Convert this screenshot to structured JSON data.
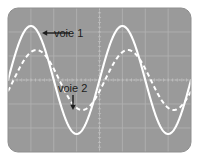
{
  "figure": {
    "background_color": "#ffffff"
  },
  "scope": {
    "name": "oscilloscope-screen",
    "screen_color": "#9a9a9a",
    "grid_color": "#b0b0b0",
    "grid_center_color": "#c0c0c0",
    "trace_color": "#ffffff",
    "bezel_radius_px": 10,
    "screen_rect": {
      "x": 8,
      "y": 8,
      "width": 183,
      "height": 144
    },
    "grid": {
      "columns": 8,
      "rows": 6,
      "center_lines_dotted": true
    }
  },
  "annotations": [
    {
      "id": "voie-1",
      "label": "voie 1",
      "text_x": 54,
      "text_y": 37,
      "arrow": {
        "from_x": 70,
        "from_y": 33,
        "to_x": 42,
        "to_y": 33,
        "direction": "left"
      },
      "color": "#1c1c1c"
    },
    {
      "id": "voie-2",
      "label": "voie 2",
      "text_x": 58,
      "text_y": 92,
      "arrow": {
        "from_x": 73,
        "from_y": 95,
        "to_x": 73,
        "to_y": 110,
        "direction": "down"
      },
      "color": "#1c1c1c"
    }
  ],
  "chart_data": {
    "type": "line",
    "title": "",
    "xlabel": "",
    "ylabel": "",
    "xlim": [
      0,
      8
    ],
    "ylim": [
      -3,
      3
    ],
    "grid": true,
    "legend_position": "inline-annotations",
    "series": [
      {
        "name": "voie 1",
        "style": "solid",
        "color": "#ffffff",
        "amplitude_div": 2.25,
        "periods_visible": 2,
        "period_div": 4.0,
        "phase_deg": 0,
        "offset_div": 0,
        "samples_x": [
          0.0,
          0.25,
          0.5,
          0.75,
          1.0,
          1.25,
          1.5,
          1.75,
          2.0,
          2.25,
          2.5,
          2.75,
          3.0,
          3.25,
          3.5,
          3.75,
          4.0,
          4.25,
          4.5,
          4.75,
          5.0,
          5.25,
          5.5,
          5.75,
          6.0,
          6.25,
          6.5,
          6.75,
          7.0,
          7.25,
          7.5,
          7.75,
          8.0
        ],
        "samples_y": [
          0.0,
          0.86,
          1.59,
          2.08,
          2.25,
          2.08,
          1.59,
          0.86,
          0.0,
          -0.86,
          -1.59,
          -2.08,
          -2.25,
          -2.08,
          -1.59,
          -0.86,
          0.0,
          0.86,
          1.59,
          2.08,
          2.25,
          2.08,
          1.59,
          0.86,
          0.0,
          -0.86,
          -1.59,
          -2.08,
          -2.25,
          -2.08,
          -1.59,
          -0.86,
          0.0
        ]
      },
      {
        "name": "voie 2",
        "style": "dashed",
        "color": "#ffffff",
        "amplitude_div": 1.25,
        "periods_visible": 2,
        "period_div": 4.0,
        "phase_deg": -22,
        "offset_div": 0,
        "samples_x": [
          0.0,
          0.25,
          0.5,
          0.75,
          1.0,
          1.25,
          1.5,
          1.75,
          2.0,
          2.25,
          2.5,
          2.75,
          3.0,
          3.25,
          3.5,
          3.75,
          4.0,
          4.25,
          4.5,
          4.75,
          5.0,
          5.25,
          5.5,
          5.75,
          6.0,
          6.25,
          6.5,
          6.75,
          7.0,
          7.25,
          7.5,
          7.75,
          8.0
        ],
        "samples_y": [
          -0.47,
          0.32,
          0.96,
          1.23,
          1.15,
          0.75,
          0.12,
          -0.57,
          -1.08,
          -1.25,
          -1.07,
          -0.6,
          0.04,
          0.68,
          1.12,
          1.25,
          1.04,
          0.54,
          -0.1,
          -0.7,
          -1.14,
          -1.25,
          -1.01,
          -0.47,
          0.18,
          0.79,
          1.18,
          1.24,
          0.94,
          0.4,
          -0.25,
          -0.83,
          -1.18
        ]
      }
    ]
  }
}
